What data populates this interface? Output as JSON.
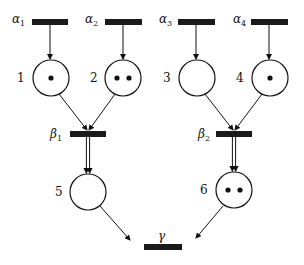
{
  "diagram": {
    "type": "petri-net",
    "colors": {
      "stroke": "#111111",
      "transition": "#1a1a1a",
      "background": "#ffffff"
    },
    "transitions": [
      {
        "id": "alpha1",
        "symbol": "α",
        "sub": "1",
        "x": 32,
        "y": 19,
        "w": 36,
        "h": 6,
        "label_x": 12,
        "label_y": 23
      },
      {
        "id": "alpha2",
        "symbol": "α",
        "sub": "2",
        "x": 105,
        "y": 19,
        "w": 37,
        "h": 6,
        "label_x": 85,
        "label_y": 23
      },
      {
        "id": "alpha3",
        "symbol": "α",
        "sub": "3",
        "x": 178,
        "y": 19,
        "w": 37,
        "h": 6,
        "label_x": 159,
        "label_y": 23
      },
      {
        "id": "alpha4",
        "symbol": "α",
        "sub": "4",
        "x": 251,
        "y": 19,
        "w": 37,
        "h": 6,
        "label_x": 233,
        "label_y": 23
      },
      {
        "id": "beta1",
        "symbol": "β",
        "sub": "1",
        "x": 70,
        "y": 131,
        "w": 36,
        "h": 6,
        "label_x": 50,
        "label_y": 138
      },
      {
        "id": "beta2",
        "symbol": "β",
        "sub": "2",
        "x": 216,
        "y": 131,
        "w": 36,
        "h": 6,
        "label_x": 198,
        "label_y": 138
      },
      {
        "id": "gamma",
        "symbol": "γ",
        "sub": "",
        "x": 144,
        "y": 244,
        "w": 38,
        "h": 6,
        "label_x": 158,
        "label_y": 240
      }
    ],
    "places": [
      {
        "id": "p1",
        "label": "1",
        "cx": 51,
        "cy": 78,
        "r": 18,
        "tokens": 1,
        "label_x": 17,
        "label_y": 82
      },
      {
        "id": "p2",
        "label": "2",
        "cx": 123,
        "cy": 78,
        "r": 18,
        "tokens": 2,
        "label_x": 90,
        "label_y": 82
      },
      {
        "id": "p3",
        "label": "3",
        "cx": 197,
        "cy": 78,
        "r": 18,
        "tokens": 0,
        "label_x": 163,
        "label_y": 82
      },
      {
        "id": "p4",
        "label": "4",
        "cx": 270,
        "cy": 78,
        "r": 18,
        "tokens": 1,
        "label_x": 236,
        "label_y": 82
      },
      {
        "id": "p5",
        "label": "5",
        "cx": 88,
        "cy": 192,
        "r": 18,
        "tokens": 0,
        "label_x": 55,
        "label_y": 196
      },
      {
        "id": "p6",
        "label": "6",
        "cx": 234,
        "cy": 190,
        "r": 18,
        "tokens": 2,
        "label_x": 200,
        "label_y": 194
      }
    ],
    "arcs": [
      {
        "from": "alpha1",
        "to": "p1",
        "x1": 50,
        "y1": 25,
        "x2": 50,
        "y2": 59,
        "weight": 1
      },
      {
        "from": "alpha2",
        "to": "p2",
        "x1": 123,
        "y1": 25,
        "x2": 123,
        "y2": 59,
        "weight": 1
      },
      {
        "from": "alpha3",
        "to": "p3",
        "x1": 196,
        "y1": 25,
        "x2": 196,
        "y2": 59,
        "weight": 1
      },
      {
        "from": "alpha4",
        "to": "p4",
        "x1": 269,
        "y1": 25,
        "x2": 269,
        "y2": 59,
        "weight": 1
      },
      {
        "from": "p1",
        "to": "beta1",
        "x1": 59,
        "y1": 94,
        "x2": 87,
        "y2": 130,
        "weight": 1
      },
      {
        "from": "p2",
        "to": "beta1",
        "x1": 115,
        "y1": 94,
        "x2": 89,
        "y2": 130,
        "weight": 1
      },
      {
        "from": "p3",
        "to": "beta2",
        "x1": 205,
        "y1": 94,
        "x2": 233,
        "y2": 130,
        "weight": 1
      },
      {
        "from": "p4",
        "to": "beta2",
        "x1": 262,
        "y1": 94,
        "x2": 235,
        "y2": 130,
        "weight": 1
      },
      {
        "from": "beta1",
        "to": "p5",
        "x1": 88,
        "y1": 137,
        "x2": 88,
        "y2": 173,
        "weight": 2
      },
      {
        "from": "beta2",
        "to": "p6",
        "x1": 234,
        "y1": 137,
        "x2": 234,
        "y2": 171,
        "weight": 2
      },
      {
        "from": "p5",
        "to": "gamma",
        "x1": 100,
        "y1": 206,
        "x2": 130,
        "y2": 240,
        "weight": 1
      },
      {
        "from": "p6",
        "to": "gamma",
        "x1": 223,
        "y1": 206,
        "x2": 196,
        "y2": 238,
        "weight": 1
      }
    ]
  }
}
